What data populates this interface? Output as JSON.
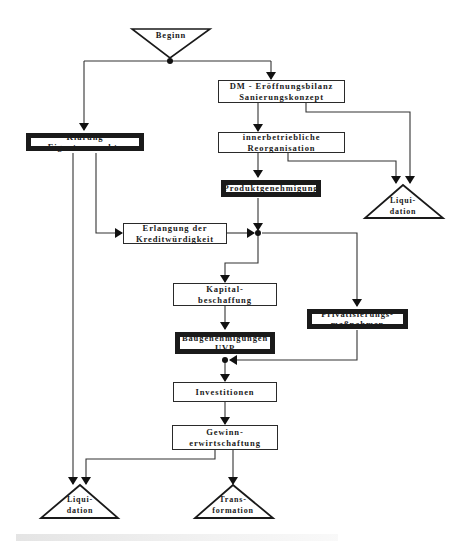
{
  "diagram": {
    "start": {
      "label": "Beginn"
    },
    "nodes": {
      "eroeffnungsbilanz": {
        "line1": "DM - Eröffnungsbilanz",
        "line2": "Sanierungskonzept"
      },
      "reorganisation": {
        "line1": "innerbetriebliche",
        "line2": "Reorganisation"
      },
      "produktgenehmigung": {
        "line1": "Produktgenehmigung"
      },
      "klaerung": {
        "line1": "Klärung Eigentumsrechte"
      },
      "kreditwuerdigkeit": {
        "line1": "Erlangung der",
        "line2": "Kreditwürdigkeit"
      },
      "kapitalbeschaffung": {
        "line1": "Kapital-",
        "line2": "beschaffung"
      },
      "privatisierung": {
        "line1": "Privatisierungs-",
        "line2": "maßnahmen"
      },
      "baugenehmigungen": {
        "line1": "Baugenehmigungen",
        "line2": "UVP"
      },
      "investitionen": {
        "line1": "Investitionen"
      },
      "gewinn": {
        "line1": "Gewinn-",
        "line2": "erwirtschaftung"
      }
    },
    "terminals": {
      "liquidation_right": {
        "line1": "Liqui-",
        "line2": "dation"
      },
      "liquidation_bottom": {
        "line1": "Liqui-",
        "line2": "dation"
      },
      "transformation": {
        "line1": "Trans-",
        "line2": "formation"
      }
    },
    "edges": [
      [
        "Beginn",
        "Klärung Eigentumsrechte"
      ],
      [
        "Beginn",
        "DM - Eröffnungsbilanz Sanierungskonzept"
      ],
      [
        "DM - Eröffnungsbilanz Sanierungskonzept",
        "innerbetriebliche Reorganisation"
      ],
      [
        "DM - Eröffnungsbilanz Sanierungskonzept",
        "Liquidation"
      ],
      [
        "innerbetriebliche Reorganisation",
        "Produktgenehmigung"
      ],
      [
        "innerbetriebliche Reorganisation",
        "Liquidation"
      ],
      [
        "Klärung Eigentumsrechte",
        "Erlangung der Kreditwürdigkeit"
      ],
      [
        "Klärung Eigentumsrechte",
        "Liquidation"
      ],
      [
        "Produktgenehmigung",
        "junction"
      ],
      [
        "Erlangung der Kreditwürdigkeit",
        "junction"
      ],
      [
        "junction",
        "Kapitalbeschaffung"
      ],
      [
        "junction",
        "Privatisierungsmaßnahmen"
      ],
      [
        "Kapitalbeschaffung",
        "Baugenehmigungen UVP"
      ],
      [
        "Privatisierungsmaßnahmen",
        "junction2"
      ],
      [
        "Baugenehmigungen UVP",
        "junction2"
      ],
      [
        "junction2",
        "Investitionen"
      ],
      [
        "Investitionen",
        "Gewinnerwirtschaftung"
      ],
      [
        "Gewinnerwirtschaftung",
        "Liquidation"
      ],
      [
        "Gewinnerwirtschaftung",
        "Transformation"
      ]
    ]
  }
}
